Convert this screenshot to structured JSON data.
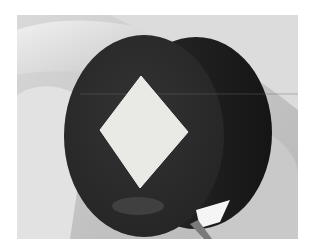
{
  "image": {
    "description": "Grayscale photo of a dark round disc with a white diamond inlay held between fingers",
    "subject": "dark disc with white diamond",
    "colors": {
      "background": "#ffffff",
      "skin_light": "#e6e6e6",
      "skin_mid": "#bdbdbd",
      "skin_shadow": "#8c8c8c",
      "disc_face": "#2b2b2b",
      "disc_edge": "#1c1c1c",
      "diamond": "#e9e9e6"
    }
  }
}
